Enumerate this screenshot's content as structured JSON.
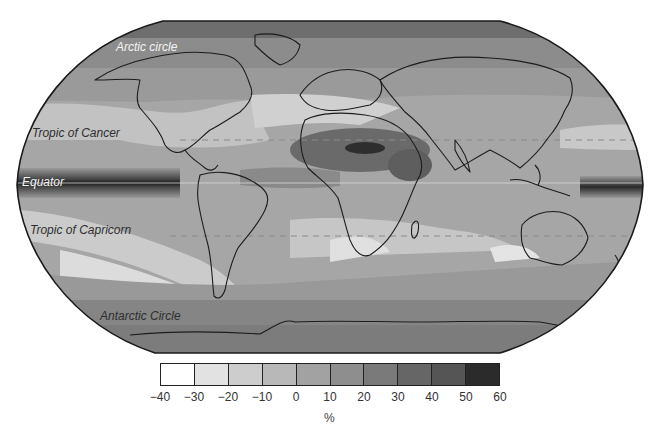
{
  "figure": {
    "type": "global choropleth map",
    "projection_shape": "rounded pseudo-cylindrical (Robinson-like)",
    "latitude_labels": [
      {
        "id": "arctic",
        "text": "Arctic circle",
        "x": 116,
        "y": 51,
        "style": "light"
      },
      {
        "id": "cancer",
        "text": "Tropic of Cancer",
        "x": 32,
        "y": 137,
        "style": "dark"
      },
      {
        "id": "equator",
        "text": "Equator",
        "x": 22,
        "y": 186,
        "style": "light"
      },
      {
        "id": "capricorn",
        "text": "Tropic of Capricorn",
        "x": 30,
        "y": 234,
        "style": "dark"
      },
      {
        "id": "antarctic",
        "text": "Antarctic Circle",
        "x": 100,
        "y": 320,
        "style": "dark"
      }
    ]
  },
  "colorbar": {
    "unit": "%",
    "tick_labels": [
      "-40",
      "-30",
      "-20",
      "-10",
      "0",
      "10",
      "20",
      "30",
      "40",
      "50",
      "60"
    ],
    "bins": [
      {
        "range": "-40 to -30",
        "color": "#ffffff"
      },
      {
        "range": "-30 to -20",
        "color": "#e2e2e2"
      },
      {
        "range": "-20 to -10",
        "color": "#cdcdcd"
      },
      {
        "range": "-10 to 0",
        "color": "#b8b8b8"
      },
      {
        "range": "0 to 10",
        "color": "#a2a2a2"
      },
      {
        "range": "10 to 20",
        "color": "#8e8e8e"
      },
      {
        "range": "20 to 30",
        "color": "#7a7a7a"
      },
      {
        "range": "30 to 40",
        "color": "#666666"
      },
      {
        "range": "40 to 50",
        "color": "#555555"
      },
      {
        "range": "50 to 60",
        "color": "#2b2b2b"
      }
    ]
  },
  "chart_data": {
    "type": "heatmap",
    "title": "",
    "xlabel": "",
    "ylabel": "",
    "colorbar_label": "%",
    "colorbar_range": [
      -40,
      60
    ],
    "colorbar_ticks": [
      -40,
      -30,
      -20,
      -10,
      0,
      10,
      20,
      30,
      40,
      50,
      60
    ],
    "reference_lines": [
      "Arctic circle",
      "Tropic of Cancer",
      "Equator",
      "Tropic of Capricorn",
      "Antarctic Circle"
    ],
    "regions_approx": [
      {
        "region": "Equatorial central/eastern Pacific",
        "value_range": "50 to 60"
      },
      {
        "region": "Equatorial western Pacific (east edge)",
        "value_range": "40 to 60"
      },
      {
        "region": "Sahara / Sahel / Arabian Peninsula",
        "value_range": "30 to 50"
      },
      {
        "region": "High latitudes (Arctic, Southern Ocean)",
        "value_range": "10 to 30"
      },
      {
        "region": "Subtropical oceans / Mediterranean",
        "value_range": "-30 to -10"
      },
      {
        "region": "Southern Africa, Australia, southern South America",
        "value_range": "-30 to 0"
      }
    ]
  }
}
